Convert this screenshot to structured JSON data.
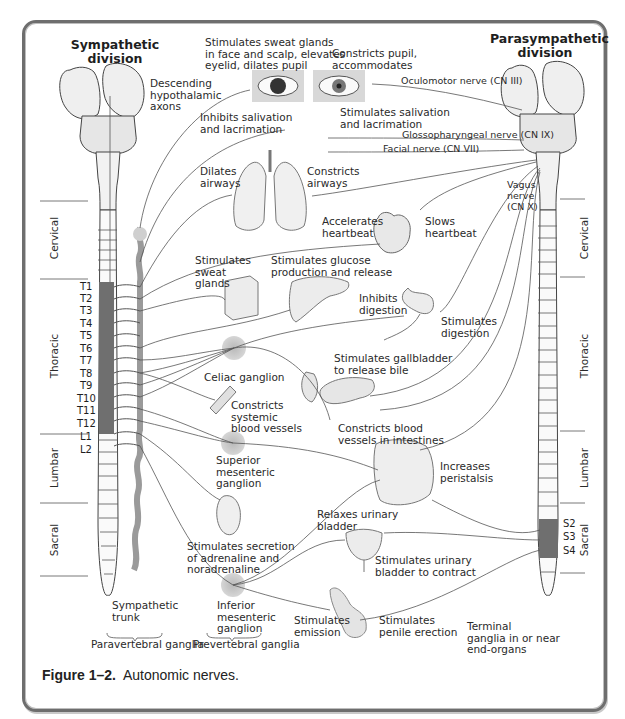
{
  "figure": {
    "caption_number": "Figure 1–2.",
    "caption_text": "Autonomic nerves.",
    "border_color": "#6e6e6e",
    "ganglion_color": "#c8c8c8",
    "segment_shade_color": "#707070"
  },
  "divisions": {
    "sympathetic": "Sympathetic\ndivision",
    "parasympathetic": "Parasympathetic\ndivision"
  },
  "spinal_regions": {
    "left": [
      "Cervical",
      "Thoracic",
      "Lumbar",
      "Sacral"
    ],
    "right": [
      "Cervical",
      "Thoracic",
      "Lumbar",
      "Sacral"
    ]
  },
  "segments": {
    "sympathetic": [
      "T1",
      "T2",
      "T3",
      "T4",
      "T5",
      "T6",
      "T7",
      "T8",
      "T9",
      "T10",
      "T11",
      "T12",
      "L1",
      "L2"
    ],
    "parasympathetic_sacral": [
      "S2",
      "S3",
      "S4"
    ]
  },
  "ganglia": {
    "celiac": "Celiac ganglion",
    "superior_mesenteric": "Superior\nmesenteric\nganglion",
    "inferior_mesenteric": "Inferior\nmesenteric\nganglion",
    "sympathetic_trunk": "Sympathetic\ntrunk",
    "paravertebral": "Paravertebral ganglia",
    "prevertebral": "Prevertebral ganglia",
    "terminal": "Terminal\nganglia in or near\nend-organs"
  },
  "nerves": {
    "hypothalamic": "Descending\nhypothalamic\naxons",
    "oculomotor": "Oculomotor nerve (CN III)",
    "glossopharyngeal": "Glossopharyngeal nerve (CN IX)",
    "facial": "Facial nerve (CN VII)",
    "vagus": "Vagus\nnerve\n(CN X)"
  },
  "effects": {
    "sympathetic": {
      "eye": "Stimulates sweat glands\nin face and scalp, elevates\neyelid, dilates pupil",
      "salivation": "Inhibits salivation\nand lacrimation",
      "airways": "Dilates\nairways",
      "heart": "Accelerates\nheartbeat",
      "sweat": "Stimulates\nsweat\nglands",
      "liver": "Stimulates glucose\nproduction and release",
      "digestion": "Inhibits\ndigestion",
      "vessels": "Constricts\nsystemic\nblood vessels",
      "intestine_vessels": "Constricts blood\nvessels in intestines",
      "adrenal": "Stimulates secretion\nof adrenaline and\nnoradrenaline",
      "bladder": "Relaxes urinary\nbladder",
      "emission": "Stimulates\nemission"
    },
    "parasympathetic": {
      "eye": "Constricts pupil,\naccommodates",
      "salivation": "Stimulates salivation\nand lacrimation",
      "airways": "Constricts\nairways",
      "heart": "Slows\nheartbeat",
      "digestion": "Stimulates\ndigestion",
      "gallbladder": "Stimulates gallbladder\nto release bile",
      "peristalsis": "Increases\nperistalsis",
      "bladder": "Stimulates urinary\nbladder to contract",
      "erection": "Stimulates\npenile erection"
    }
  }
}
